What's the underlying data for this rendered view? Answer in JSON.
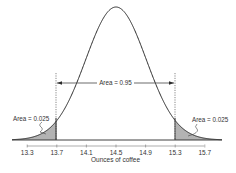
{
  "chart_data": {
    "type": "area",
    "title": "",
    "xlabel": "Ounces of coffee",
    "ylabel": "",
    "distribution": "normal",
    "mean": 14.5,
    "std": 0.408,
    "xlim": [
      13.0,
      16.0
    ],
    "ticks": [
      13.3,
      13.7,
      14.1,
      14.5,
      14.9,
      15.3,
      15.7
    ],
    "tick_labels": [
      "13.3",
      "13.7",
      "14.1",
      "14.5",
      "14.9",
      "15.3",
      "15.7"
    ],
    "grid": false,
    "legend": null,
    "shaded_regions": [
      {
        "from": 13.0,
        "to": 13.7,
        "area": 0.025,
        "label": "Area = 0.025",
        "color": "#b3b3b3"
      },
      {
        "from": 15.3,
        "to": 16.0,
        "area": 0.025,
        "label": "Area = 0.025",
        "color": "#b3b3b3"
      }
    ],
    "central_region": {
      "from": 13.7,
      "to": 15.3,
      "area": 0.95,
      "label": "Area = 0.95"
    },
    "annotations": [
      {
        "text": "Area = 0.95",
        "x": 14.5,
        "type": "double-arrow",
        "span": [
          13.7,
          15.3
        ]
      },
      {
        "text": "Area = 0.025",
        "x": 13.5,
        "side": "left"
      },
      {
        "text": "Area = 0.025",
        "x": 15.5,
        "side": "right"
      }
    ]
  },
  "labels": {
    "xlabel": "Ounces of coffee",
    "center_area": "Area = 0.95",
    "left_area": "Area = 0.025",
    "right_area": "Area = 0.025"
  },
  "colors": {
    "curve": "#2b2b2b",
    "shade": "#b3b3b3",
    "axis": "#555555",
    "text": "#333333"
  }
}
